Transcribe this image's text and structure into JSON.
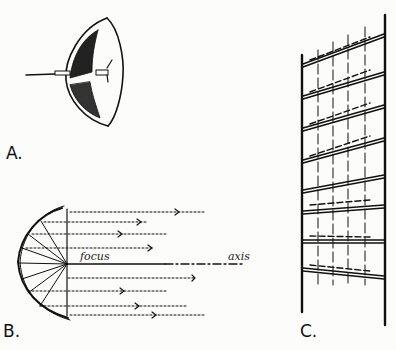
{
  "figure": {
    "panels": [
      {
        "id": "A",
        "label": "A.",
        "description": "Spherical/parabolic reflector dish with lamp at focus"
      },
      {
        "id": "B",
        "label": "B.",
        "description": "Parabolic reflector cross-section showing rays from focus reflected parallel to axis",
        "annotations": {
          "focus": "focus",
          "axis": "axis"
        }
      },
      {
        "id": "C",
        "label": "C.",
        "description": "Antenna array / rack of dipoles on a frame"
      }
    ]
  },
  "colors": {
    "ink": "#111111",
    "paper": "#fcfcfa"
  }
}
